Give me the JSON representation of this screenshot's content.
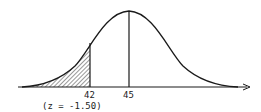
{
  "diagram": {
    "type": "normal-distribution-curve",
    "mean_label": "45",
    "cutoff_label": "42",
    "z_label": "(z = -1.50)",
    "shaded_region": "left tail below 42",
    "colors": {
      "line": "#1a1a1a",
      "background": "#ffffff",
      "hatch": "#333333"
    }
  }
}
